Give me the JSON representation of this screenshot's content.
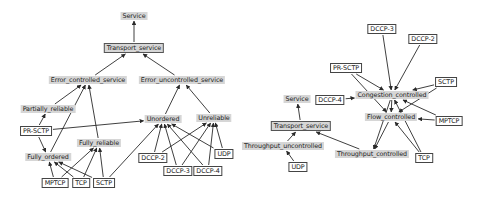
{
  "diagrams": [
    {
      "name": "service-taxonomy",
      "nodes": [
        {
          "id": "service",
          "label": "Service",
          "kind": "concept",
          "x": 134,
          "y": 16
        },
        {
          "id": "transport_service",
          "label": "Transport_service",
          "kind": "concept-boxed",
          "x": 134,
          "y": 48
        },
        {
          "id": "error_controlled_service",
          "label": "Error_controlled_service",
          "kind": "concept",
          "x": 88,
          "y": 80
        },
        {
          "id": "error_uncontrolled_service",
          "label": "Error_uncontrolled_service",
          "kind": "concept",
          "x": 182,
          "y": 80
        },
        {
          "id": "partially_reliable",
          "label": "Partially_reliable",
          "kind": "concept",
          "x": 48,
          "y": 109
        },
        {
          "id": "pr_sctp",
          "label": "PR-SCTP",
          "kind": "instance",
          "x": 36,
          "y": 131
        },
        {
          "id": "fully_reliable",
          "label": "Fully_reliable",
          "kind": "concept",
          "x": 99,
          "y": 143
        },
        {
          "id": "fully_ordered",
          "label": "Fully_ordered",
          "kind": "concept",
          "x": 48,
          "y": 157
        },
        {
          "id": "unordered",
          "label": "Unordered",
          "kind": "concept",
          "x": 163,
          "y": 119
        },
        {
          "id": "unreliable",
          "label": "Unreliable",
          "kind": "concept",
          "x": 214,
          "y": 118
        },
        {
          "id": "mptcp",
          "label": "MPTCP",
          "kind": "instance",
          "x": 55,
          "y": 183
        },
        {
          "id": "tcp",
          "label": "TCP",
          "kind": "instance",
          "x": 81,
          "y": 183
        },
        {
          "id": "sctp",
          "label": "SCTP",
          "kind": "instance",
          "x": 104,
          "y": 183
        },
        {
          "id": "dccp2",
          "label": "DCCP-2",
          "kind": "instance",
          "x": 153,
          "y": 158
        },
        {
          "id": "dccp3",
          "label": "DCCP-3",
          "kind": "instance",
          "x": 178,
          "y": 171
        },
        {
          "id": "dccp4",
          "label": "DCCP-4",
          "kind": "instance",
          "x": 208,
          "y": 171
        },
        {
          "id": "udp",
          "label": "UDP",
          "kind": "instance",
          "x": 224,
          "y": 154
        }
      ],
      "edges": [
        [
          "transport_service",
          "service"
        ],
        [
          "error_controlled_service",
          "transport_service"
        ],
        [
          "error_uncontrolled_service",
          "transport_service"
        ],
        [
          "partially_reliable",
          "error_controlled_service"
        ],
        [
          "fully_ordered",
          "error_controlled_service"
        ],
        [
          "fully_reliable",
          "error_controlled_service"
        ],
        [
          "unordered",
          "error_uncontrolled_service"
        ],
        [
          "unreliable",
          "error_uncontrolled_service"
        ],
        [
          "pr_sctp",
          "partially_reliable"
        ],
        [
          "pr_sctp",
          "fully_ordered"
        ],
        [
          "pr_sctp",
          "unordered"
        ],
        [
          "mptcp",
          "fully_ordered"
        ],
        [
          "mptcp",
          "fully_reliable"
        ],
        [
          "tcp",
          "fully_ordered"
        ],
        [
          "tcp",
          "fully_reliable"
        ],
        [
          "sctp",
          "fully_ordered"
        ],
        [
          "sctp",
          "fully_reliable"
        ],
        [
          "sctp",
          "unordered"
        ],
        [
          "dccp2",
          "unordered"
        ],
        [
          "dccp2",
          "unreliable"
        ],
        [
          "dccp3",
          "unordered"
        ],
        [
          "dccp3",
          "unreliable"
        ],
        [
          "dccp4",
          "unordered"
        ],
        [
          "dccp4",
          "unreliable"
        ],
        [
          "udp",
          "unordered"
        ],
        [
          "udp",
          "unreliable"
        ]
      ]
    },
    {
      "name": "congestion-taxonomy",
      "nodes": [
        {
          "id": "r_dccp3",
          "label": "DCCP-3",
          "kind": "instance",
          "x": 382,
          "y": 29
        },
        {
          "id": "r_dccp2",
          "label": "DCCP-2",
          "kind": "instance",
          "x": 423,
          "y": 39
        },
        {
          "id": "r_pr_sctp",
          "label": "PR-SCTP",
          "kind": "instance",
          "x": 346,
          "y": 68
        },
        {
          "id": "r_sctp",
          "label": "SCTP",
          "kind": "instance",
          "x": 446,
          "y": 82
        },
        {
          "id": "r_congestion_controlled",
          "label": "Congestion_controlled",
          "kind": "concept",
          "x": 392,
          "y": 95
        },
        {
          "id": "r_dccp4",
          "label": "DCCP-4",
          "kind": "instance",
          "x": 330,
          "y": 100
        },
        {
          "id": "r_service",
          "label": "Service",
          "kind": "concept",
          "x": 297,
          "y": 99
        },
        {
          "id": "r_flow_controlled",
          "label": "Flow_controlled",
          "kind": "concept",
          "x": 391,
          "y": 117
        },
        {
          "id": "r_mptcp",
          "label": "MPTCP",
          "kind": "instance",
          "x": 449,
          "y": 121
        },
        {
          "id": "r_transport_service",
          "label": "Transport_service",
          "kind": "concept-boxed",
          "x": 301,
          "y": 126
        },
        {
          "id": "r_throughput_uncontrolled",
          "label": "Throughput_uncontrolled",
          "kind": "concept",
          "x": 283,
          "y": 146
        },
        {
          "id": "r_throughput_controlled",
          "label": "Throughput_controlled",
          "kind": "concept",
          "x": 372,
          "y": 154
        },
        {
          "id": "r_tcp",
          "label": "TCP",
          "kind": "instance",
          "x": 424,
          "y": 158
        },
        {
          "id": "r_udp",
          "label": "UDP",
          "kind": "instance",
          "x": 298,
          "y": 167
        }
      ],
      "edges": [
        [
          "r_transport_service",
          "r_service"
        ],
        [
          "r_throughput_uncontrolled",
          "r_transport_service"
        ],
        [
          "r_throughput_controlled",
          "r_transport_service"
        ],
        [
          "r_udp",
          "r_throughput_uncontrolled"
        ],
        [
          "r_dccp3",
          "r_congestion_controlled"
        ],
        [
          "r_dccp2",
          "r_congestion_controlled"
        ],
        [
          "r_pr_sctp",
          "r_congestion_controlled"
        ],
        [
          "r_pr_sctp",
          "r_flow_controlled"
        ],
        [
          "r_sctp",
          "r_congestion_controlled"
        ],
        [
          "r_sctp",
          "r_flow_controlled"
        ],
        [
          "r_dccp4",
          "r_congestion_controlled"
        ],
        [
          "r_mptcp",
          "r_congestion_controlled"
        ],
        [
          "r_mptcp",
          "r_flow_controlled"
        ],
        [
          "r_tcp",
          "r_congestion_controlled"
        ],
        [
          "r_tcp",
          "r_flow_controlled"
        ],
        [
          "r_congestion_controlled",
          "r_throughput_controlled"
        ],
        [
          "r_flow_controlled",
          "r_throughput_controlled"
        ],
        [
          "r_congestion_controlled",
          "r_flow_controlled"
        ]
      ]
    }
  ],
  "colors": {
    "concept_fill": "#d6d6d6",
    "instance_fill": "#ffffff",
    "edge": "#2a2a2a"
  }
}
